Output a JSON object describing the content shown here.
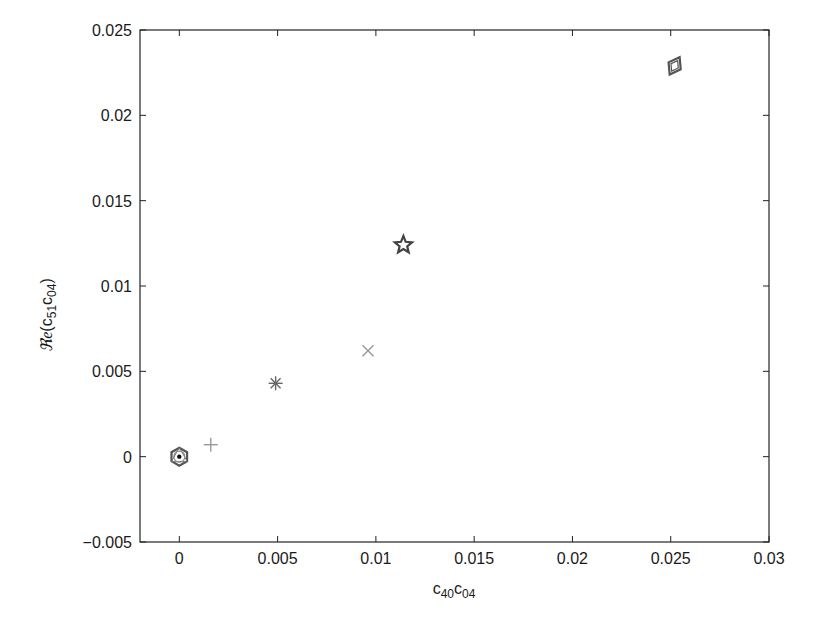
{
  "chart_data": {
    "type": "scatter",
    "title": "",
    "xlabel": "c40c04",
    "xlabel_parts": {
      "base1": "c",
      "sub1": "40",
      "base2": "c",
      "sub2": "04"
    },
    "ylabel": "Re(c51c04)",
    "ylabel_parts": {
      "re": "ℜe",
      "open": "(",
      "base1": "c",
      "sub1": "51",
      "base2": "c",
      "sub2": "04",
      "close": ")"
    },
    "xlim": [
      -0.002,
      0.03
    ],
    "ylim": [
      -0.005,
      0.025
    ],
    "grid": false,
    "legend": null,
    "x_ticks": [
      0,
      0.005,
      0.01,
      0.015,
      0.02,
      0.025,
      0.03
    ],
    "x_tick_labels": [
      "0",
      "0.005",
      "0.01",
      "0.015",
      "0.02",
      "0.025",
      "0.03"
    ],
    "y_ticks": [
      -0.005,
      0,
      0.005,
      0.01,
      0.015,
      0.02,
      0.025
    ],
    "y_tick_labels": [
      "−0.005",
      "0",
      "0.005",
      "0.01",
      "0.015",
      "0.02",
      "0.025"
    ],
    "series": [
      {
        "name": "hexagon-circle",
        "marker": "hexagon",
        "color": "#555555",
        "x": [
          0
        ],
        "y": [
          0
        ]
      },
      {
        "name": "plus",
        "marker": "plus",
        "color": "#999999",
        "x": [
          0.0016
        ],
        "y": [
          0.0007
        ]
      },
      {
        "name": "asterisk",
        "marker": "asterisk",
        "color": "#666666",
        "x": [
          0.0049
        ],
        "y": [
          0.0043
        ]
      },
      {
        "name": "x-mark",
        "marker": "x",
        "color": "#999999",
        "x": [
          0.0096
        ],
        "y": [
          0.0062
        ]
      },
      {
        "name": "star",
        "marker": "star",
        "color": "#444444",
        "x": [
          0.0114
        ],
        "y": [
          0.0124
        ]
      },
      {
        "name": "diamond",
        "marker": "diamond",
        "color": "#555555",
        "x": [
          0.0252
        ],
        "y": [
          0.0229
        ]
      }
    ]
  }
}
